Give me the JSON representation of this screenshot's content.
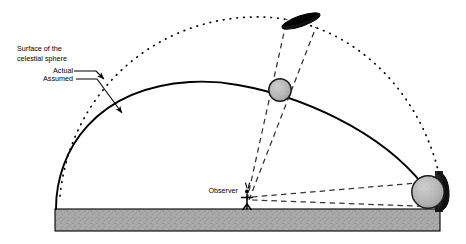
{
  "figure": {
    "type": "astronomy-diagram",
    "background_color": "#ffffff"
  },
  "labels": {
    "surface_line1": "Surface of the",
    "surface_line2": "celestial sphere",
    "actual": "Actual",
    "assumed": "Assumed",
    "observer": "Observer"
  },
  "colors": {
    "ink": "#000000",
    "ground_fill": "#a8a8a8",
    "ground_stroke": "#000000",
    "body_fill": "#b4b4b4",
    "body_stroke": "#1a1a1a",
    "flat_body_fill": "#111111",
    "dashed_stroke": "#2a2a2a",
    "dotted_stroke": "#000000",
    "solid_arc_stroke": "#000000"
  },
  "elements": {
    "dotted_arc": {
      "name": "actual-celestial-sphere-arc",
      "style": "dotted",
      "meaning": "Actual surface of the celestial sphere"
    },
    "solid_arc": {
      "name": "assumed-celestial-sphere-arc",
      "style": "solid",
      "meaning": "Assumed surface of the celestial sphere"
    },
    "ground": {
      "name": "ground-band",
      "style": "stippled-gray"
    },
    "observer": {
      "name": "observer-figure",
      "style": "stick-figure"
    },
    "zenith_body": {
      "name": "celestial-body-high-altitude",
      "style": "gray-circle"
    },
    "zenith_true_body": {
      "name": "true-body-position-high",
      "style": "dark-flat-ellipse"
    },
    "horizon_body": {
      "name": "celestial-body-near-horizon",
      "style": "gray-circle"
    },
    "horizon_true_body": {
      "name": "true-body-position-horizon",
      "style": "dark-flattened-vertical"
    },
    "sight_lines": {
      "name": "observer-sight-lines",
      "style": "dashed",
      "count": 4
    }
  },
  "geometry": {
    "ground_top_y": 209,
    "ground_bottom_y": 231,
    "ground_left_x": 55,
    "ground_right_x": 440,
    "observer_x": 247,
    "observer_base_y": 209
  }
}
